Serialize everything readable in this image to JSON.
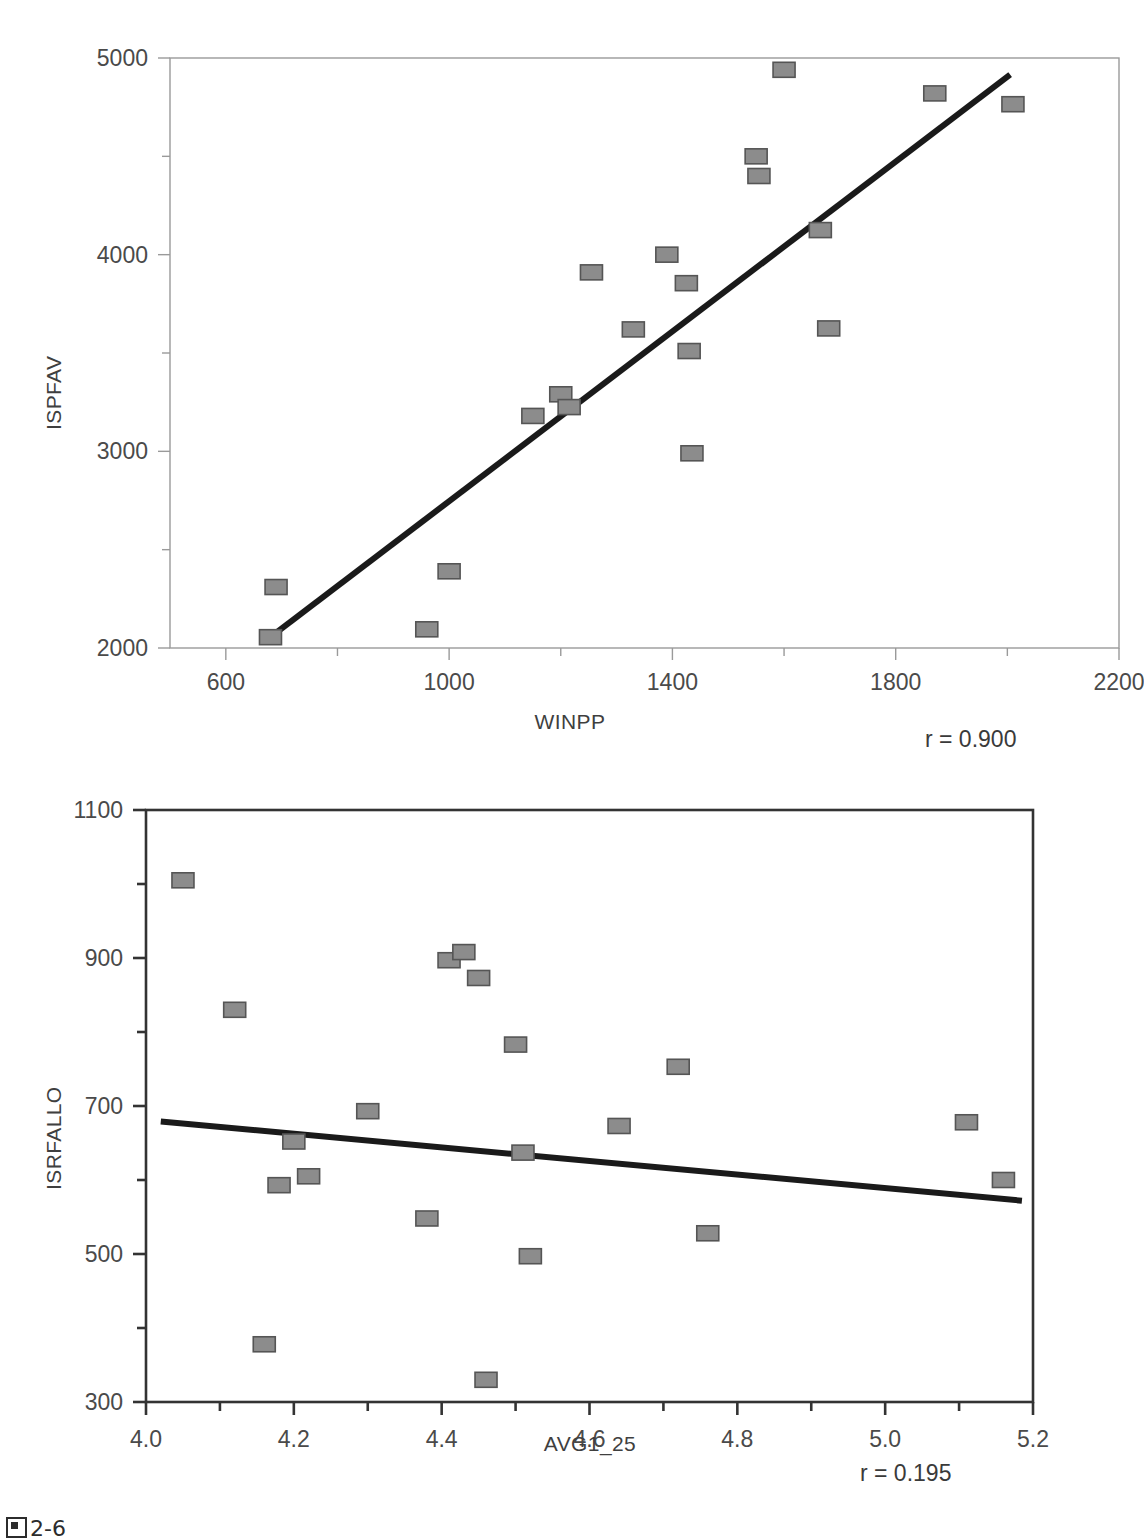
{
  "caption": "2-6",
  "charts": [
    {
      "id": "ispfav-winpp",
      "type": "scatter",
      "title": "",
      "xlabel": "WINPP",
      "ylabel": "ISPFAV",
      "annotation": "r = 0.900",
      "r_value": 0.9,
      "xlim": [
        500,
        2200
      ],
      "ylim": [
        2000,
        5000
      ],
      "xticks": [
        600,
        1000,
        1400,
        1800,
        2200
      ],
      "xtick_labels": [
        "600",
        "1000",
        "1400",
        "1800",
        "2200"
      ],
      "xminor": [
        800,
        1200,
        1600,
        2000
      ],
      "yticks": [
        2000,
        3000,
        4000,
        5000
      ],
      "ytick_labels": [
        "2000",
        "3000",
        "4000",
        "5000"
      ],
      "yminor": [
        2500,
        3500,
        4500
      ],
      "grid": false,
      "marker_fill": "#8c8c8c",
      "marker_edge": "#555555",
      "line_color": "#1a1a1a",
      "frame_color": "#9a9a9a",
      "points": [
        {
          "x": 690,
          "y": 2310
        },
        {
          "x": 680,
          "y": 2055
        },
        {
          "x": 960,
          "y": 2095
        },
        {
          "x": 1000,
          "y": 2390
        },
        {
          "x": 1150,
          "y": 3180
        },
        {
          "x": 1200,
          "y": 3290
        },
        {
          "x": 1215,
          "y": 3225
        },
        {
          "x": 1255,
          "y": 3910
        },
        {
          "x": 1330,
          "y": 3620
        },
        {
          "x": 1390,
          "y": 4000
        },
        {
          "x": 1425,
          "y": 3855
        },
        {
          "x": 1430,
          "y": 3510
        },
        {
          "x": 1435,
          "y": 2990
        },
        {
          "x": 1550,
          "y": 4500
        },
        {
          "x": 1555,
          "y": 4400
        },
        {
          "x": 1600,
          "y": 4940
        },
        {
          "x": 1665,
          "y": 4125
        },
        {
          "x": 1680,
          "y": 3625
        },
        {
          "x": 1870,
          "y": 4820
        },
        {
          "x": 2010,
          "y": 4765
        }
      ],
      "fit_line": {
        "x1": 675,
        "y1": 2045,
        "x2": 2005,
        "y2": 4915
      }
    },
    {
      "id": "isrfallo-avg1-25",
      "type": "scatter",
      "title": "",
      "xlabel": "AVG1_25",
      "ylabel": "ISRFALLO",
      "annotation": "r = 0.195",
      "r_value": 0.195,
      "xlim": [
        4.0,
        5.2
      ],
      "ylim": [
        300,
        1100
      ],
      "xticks": [
        4.0,
        4.2,
        4.4,
        4.6,
        4.8,
        5.0,
        5.2
      ],
      "xtick_labels": [
        "4.0",
        "4.2",
        "4.4",
        "4.6",
        "4.8",
        "5.0",
        "5.2"
      ],
      "xminor": [
        4.1,
        4.3,
        4.5,
        4.7,
        4.9,
        5.1
      ],
      "yticks": [
        300,
        500,
        700,
        900,
        1100
      ],
      "ytick_labels": [
        "300",
        "500",
        "700",
        "900",
        "1100"
      ],
      "yminor": [
        400,
        600,
        800,
        1000
      ],
      "grid": false,
      "marker_fill": "#8c8c8c",
      "marker_edge": "#555555",
      "line_color": "#1a1a1a",
      "frame_color": "#333333",
      "points": [
        {
          "x": 4.05,
          "y": 1005
        },
        {
          "x": 4.12,
          "y": 830
        },
        {
          "x": 4.16,
          "y": 378
        },
        {
          "x": 4.18,
          "y": 593
        },
        {
          "x": 4.2,
          "y": 652
        },
        {
          "x": 4.22,
          "y": 605
        },
        {
          "x": 4.3,
          "y": 693
        },
        {
          "x": 4.38,
          "y": 548
        },
        {
          "x": 4.41,
          "y": 897
        },
        {
          "x": 4.43,
          "y": 908
        },
        {
          "x": 4.45,
          "y": 873
        },
        {
          "x": 4.46,
          "y": 330
        },
        {
          "x": 4.5,
          "y": 783
        },
        {
          "x": 4.51,
          "y": 637
        },
        {
          "x": 4.52,
          "y": 497
        },
        {
          "x": 4.64,
          "y": 673
        },
        {
          "x": 4.72,
          "y": 753
        },
        {
          "x": 4.76,
          "y": 528
        },
        {
          "x": 5.11,
          "y": 678
        },
        {
          "x": 5.16,
          "y": 600
        }
      ],
      "fit_line": {
        "x1": 4.02,
        "y1": 679,
        "x2": 5.185,
        "y2": 572
      }
    }
  ]
}
